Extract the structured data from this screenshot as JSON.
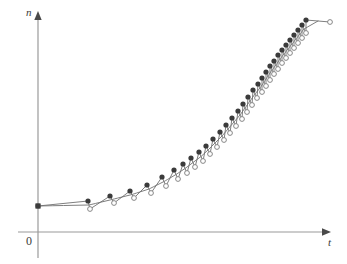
{
  "figure": {
    "width": 347,
    "height": 264,
    "background": "#ffffff"
  },
  "axes": {
    "y_axis_label": "n",
    "x_axis_label": "t",
    "origin_label": "0",
    "x_axis_pixel_y": 232,
    "y_axis_pixel_x": 38,
    "x_axis_end_pixel_x": 330,
    "y_axis_top_pixel_y": 14,
    "axis_color": "#8c8c8c",
    "arrowhead_color": "#4a4a4a"
  },
  "style": {
    "curve_color": "#6f6f6f",
    "filled_marker_color": "#3b3b3b",
    "open_marker_stroke": "#7a7a7a",
    "open_marker_fill": "#ffffff",
    "filled_marker_radius": 2.6,
    "open_marker_radius": 2.4,
    "line_width": 0.9
  },
  "chart_data": {
    "type": "line",
    "title": "",
    "subtitle": "",
    "xlabel": "t",
    "ylabel": "n",
    "grid": false,
    "legend_position": "none",
    "xlim": [
      0,
      1
    ],
    "ylim": [
      0,
      1
    ],
    "axis_ticks": {
      "x": [],
      "y": []
    },
    "annotations": [
      {
        "text": "0",
        "role": "origin-label"
      },
      {
        "text": "n",
        "role": "y-axis-label"
      },
      {
        "text": "t",
        "role": "x-axis-label"
      }
    ],
    "series": [
      {
        "name": "filled-circles",
        "marker": "filled-circle",
        "x": [
          38,
          88,
          110,
          130,
          147,
          162,
          174,
          183,
          191,
          199,
          206,
          213,
          220,
          226,
          232,
          238,
          243,
          248,
          253,
          258,
          262,
          266,
          270,
          274,
          278,
          282,
          286,
          290,
          294,
          298,
          302,
          306
        ],
        "y": [
          206,
          201,
          196,
          191,
          185,
          177,
          170,
          164,
          158,
          152,
          146,
          139,
          132,
          125,
          118,
          111,
          104,
          97,
          90,
          84,
          78,
          72,
          66,
          61,
          55,
          50,
          45,
          40,
          35,
          30,
          25,
          20
        ]
      },
      {
        "name": "open-circles",
        "marker": "open-circle",
        "x": [
          38,
          90,
          114,
          134,
          151,
          166,
          178,
          187,
          195,
          203,
          210,
          217,
          224,
          230,
          236,
          242,
          247,
          252,
          257,
          262,
          266,
          270,
          274,
          278,
          282,
          286,
          290,
          294,
          298,
          302,
          306,
          330
        ],
        "y": [
          206,
          209,
          203,
          198,
          193,
          186,
          179,
          173,
          167,
          161,
          154,
          147,
          140,
          133,
          126,
          119,
          112,
          105,
          98,
          92,
          86,
          80,
          74,
          69,
          63,
          58,
          53,
          48,
          43,
          38,
          33,
          22
        ]
      }
    ]
  }
}
